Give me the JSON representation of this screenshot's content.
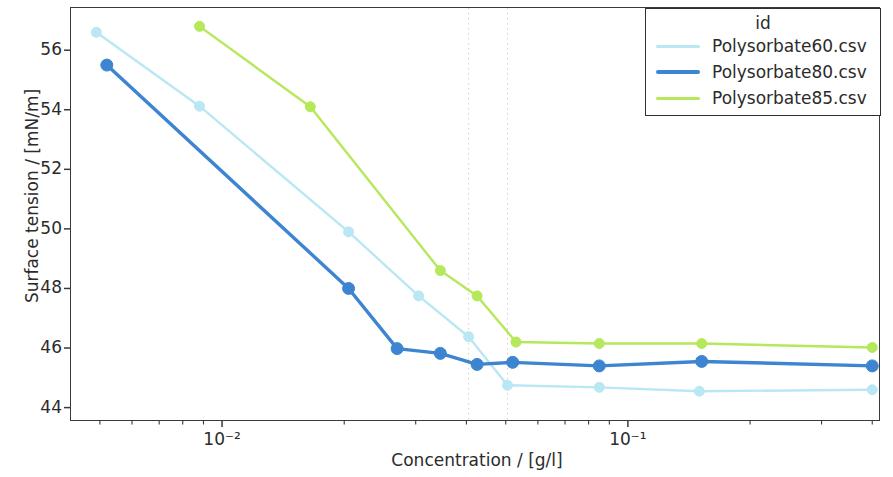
{
  "chart_data": {
    "type": "line",
    "title": "",
    "xlabel": "Concentration / [g/l]",
    "ylabel": "Surface tension / [mN/m]",
    "xscale": "log",
    "yscale": "linear",
    "xlim": [
      0.00422,
      0.418
    ],
    "ylim": [
      43.55,
      57.45
    ],
    "xticks": [
      0.01,
      0.1
    ],
    "xtick_labels": [
      "10⁻²",
      "10⁻¹"
    ],
    "yticks": [
      44,
      46,
      48,
      50,
      52,
      54,
      56
    ],
    "ytick_labels": [
      "44",
      "46",
      "48",
      "50",
      "52",
      "54",
      "56"
    ],
    "grid": false,
    "legend_title": "id",
    "legend_position": "top-right",
    "markers": "circle",
    "vlines": [
      0.0405,
      0.0505
    ],
    "vline_style": "dotted",
    "series": [
      {
        "name": "Polysorbate60.csv",
        "color": "#b9e7f4",
        "x": [
          0.0049,
          0.0088,
          0.0205,
          0.0305,
          0.0405,
          0.0505,
          0.085,
          0.15,
          0.4
        ],
        "y": [
          56.6,
          54.12,
          49.9,
          47.75,
          46.38,
          44.75,
          44.68,
          44.55,
          44.6
        ]
      },
      {
        "name": "Polysorbate80.csv",
        "color": "#3d85d0",
        "x": [
          0.0052,
          0.0205,
          0.027,
          0.0345,
          0.0425,
          0.052,
          0.085,
          0.152,
          0.4
        ],
        "y": [
          55.5,
          48.0,
          45.98,
          45.82,
          45.45,
          45.52,
          45.4,
          45.55,
          45.4
        ]
      },
      {
        "name": "Polysorbate85.csv",
        "color": "#b5e85a",
        "x": [
          0.0088,
          0.0165,
          0.0345,
          0.0425,
          0.053,
          0.085,
          0.152,
          0.4
        ],
        "y": [
          56.8,
          54.1,
          48.6,
          47.75,
          46.2,
          46.15,
          46.15,
          46.02
        ]
      }
    ]
  },
  "axes": {
    "ylabel": "Surface tension / [mN/m]",
    "xlabel": "Concentration / [g/l]"
  },
  "legend": {
    "title": "id",
    "entries": [
      {
        "label": "Polysorbate60.csv",
        "color": "#b9e7f4"
      },
      {
        "label": "Polysorbate80.csv",
        "color": "#3d85d0"
      },
      {
        "label": "Polysorbate85.csv",
        "color": "#b5e85a"
      }
    ]
  }
}
